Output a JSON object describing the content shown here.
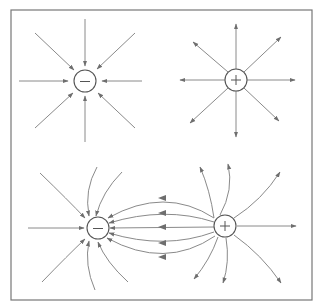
{
  "figure": {
    "panels": [
      {
        "name": "isolated-negative-charge",
        "charge_sign": "-",
        "field_direction": "inward",
        "line_count": 8
      },
      {
        "name": "isolated-positive-charge",
        "charge_sign": "+",
        "field_direction": "outward",
        "line_count": 8
      },
      {
        "name": "dipole",
        "charges": [
          "-",
          "+"
        ],
        "field_direction": "from + to -"
      }
    ],
    "colors": {
      "lines": "#8a8a8a",
      "charge_outline": "#555555",
      "frame": "#777777",
      "background": "#ffffff"
    }
  },
  "labels": {
    "neg_top": "−",
    "pos_top": "+",
    "neg_dipole": "−",
    "pos_dipole": "+"
  }
}
